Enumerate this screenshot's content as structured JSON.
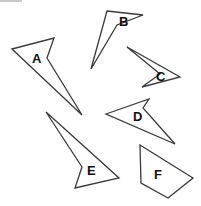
{
  "diagram": {
    "background": "#ffffff",
    "stroke_color": "#3a3a3a",
    "label_color": "#111111",
    "shapes": [
      {
        "label": "A",
        "points": "12,49 54,38 47,58 82,115",
        "label_x": 32,
        "label_y": 63
      },
      {
        "label": "B",
        "points": "107,11 143,15 117,25 91,69",
        "label_x": 119,
        "label_y": 26
      },
      {
        "label": "C",
        "points": "127,47 180,77 142,87 160,74",
        "label_x": 156,
        "label_y": 81
      },
      {
        "label": "D",
        "points": "106,114 149,99 143,108 175,144",
        "label_x": 133,
        "label_y": 121
      },
      {
        "label": "E",
        "points": "46,112 119,178 75,188 82,167",
        "label_x": 87,
        "label_y": 175
      },
      {
        "label": "F",
        "points": "140,145 193,178 168,198 141,183",
        "label_x": 154,
        "label_y": 179
      }
    ]
  }
}
